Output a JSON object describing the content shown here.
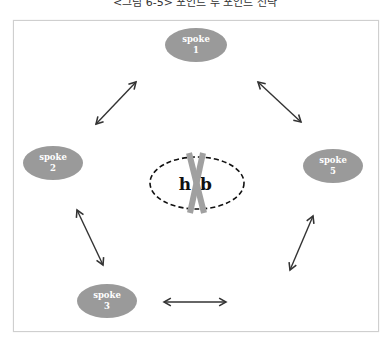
{
  "figure": {
    "title": "<그림 6-5> 포인트 투 포인트 전략"
  },
  "hub": {
    "label_left": "h",
    "label_right": "b",
    "full_label": "hub",
    "crossed_out": true,
    "outline_style": "dashed"
  },
  "spokes": [
    {
      "word": "spoke",
      "number": "1"
    },
    {
      "word": "spoke",
      "number": "2"
    },
    {
      "word": "spoke",
      "number": "3"
    },
    {
      "word": "spoke",
      "number": "4"
    },
    {
      "word": "spoke",
      "number": "5"
    }
  ],
  "connections": [
    {
      "from": "spoke 1",
      "to": "spoke 2",
      "type": "bidirectional"
    },
    {
      "from": "spoke 1",
      "to": "spoke 5",
      "type": "bidirectional"
    },
    {
      "from": "spoke 2",
      "to": "spoke 3",
      "type": "bidirectional"
    },
    {
      "from": "spoke 3",
      "to": "spoke 4",
      "type": "bidirectional"
    },
    {
      "from": "spoke 4",
      "to": "spoke 5",
      "type": "bidirectional"
    }
  ],
  "colors": {
    "spoke_fill": "#9a9a9a",
    "spoke_text": "#ffffff",
    "arrow": "#333333",
    "cross": "#a0a0a0",
    "hub_outline": "#111111"
  }
}
